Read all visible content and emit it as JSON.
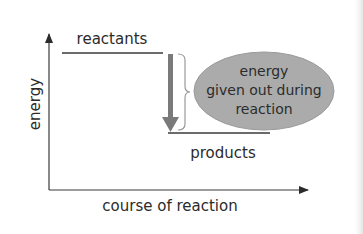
{
  "diagram": {
    "type": "energy-level-diagram",
    "y_axis_label": "energy",
    "x_axis_label": "course of reaction",
    "reactants_label": "reactants",
    "products_label": "products",
    "ellipse_lines": [
      "energy",
      "given out during",
      "reaction"
    ],
    "colors": {
      "axis": "#3a3a3a",
      "level_line": "#3a3a3a",
      "arrow": "#7a7a7a",
      "ellipse_fill": "#ababab",
      "ellipse_stroke": "#9a9a9a",
      "text": "#2b2b2b"
    }
  }
}
